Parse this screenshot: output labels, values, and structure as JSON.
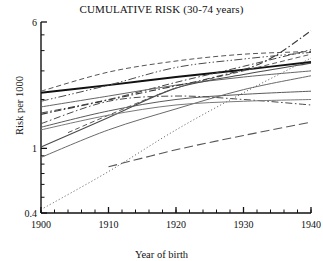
{
  "chart_data": {
    "type": "line",
    "title": "CUMULATIVE RISK (30-74 years)",
    "xlabel": "Year of birth",
    "ylabel": "Risk per 1000",
    "xlim": [
      1900,
      1940
    ],
    "ylim": [
      0.4,
      6
    ],
    "yscale": "log",
    "grid": false,
    "legend": null,
    "x_ticks": [
      1900,
      1910,
      1920,
      1930,
      1940
    ],
    "x_tick_labels": [
      "1900",
      "1910",
      "1920",
      "1930",
      "1940"
    ],
    "x_minor_step": 2,
    "y_ticks": [
      0.4,
      1,
      6
    ],
    "y_tick_labels": [
      "0.4",
      "1",
      "6"
    ],
    "y_minor_ticks": [
      0.5,
      0.6,
      0.7,
      0.8,
      0.9,
      2,
      3,
      4,
      5
    ],
    "series": [
      {
        "name": "series-1",
        "style": "solid",
        "width": 1.9,
        "color": "#111111",
        "x": [
          1900,
          1910,
          1920,
          1930,
          1940
        ],
        "values": [
          2.2,
          2.45,
          2.75,
          3.05,
          3.4
        ]
      },
      {
        "name": "series-2",
        "style": "dashed",
        "width": 1.0,
        "color": "#555555",
        "x": [
          1900,
          1910,
          1920,
          1930,
          1940
        ],
        "values": [
          2.25,
          2.95,
          3.45,
          3.8,
          3.95
        ]
      },
      {
        "name": "series-3",
        "style": "dashdot",
        "width": 1.0,
        "color": "#444444",
        "x": [
          1900,
          1910,
          1920,
          1930,
          1940
        ],
        "values": [
          1.65,
          2.0,
          2.55,
          3.2,
          4.05
        ]
      },
      {
        "name": "series-4",
        "style": "solid",
        "width": 1.0,
        "color": "#666666",
        "x": [
          1900,
          1910,
          1920,
          1930,
          1940
        ],
        "values": [
          1.8,
          2.1,
          2.45,
          2.75,
          3.0
        ]
      },
      {
        "name": "series-5",
        "style": "solid",
        "width": 1.1,
        "color": "#4a4a4a",
        "x": [
          1900,
          1910,
          1920,
          1930,
          1940
        ],
        "values": [
          1.02,
          1.55,
          2.35,
          2.85,
          3.35
        ]
      },
      {
        "name": "series-6",
        "style": "solid",
        "width": 1.0,
        "color": "#5a5a5a",
        "x": [
          1900,
          1910,
          1920,
          1930,
          1940
        ],
        "values": [
          1.35,
          1.7,
          2.0,
          2.15,
          2.25
        ]
      },
      {
        "name": "series-7",
        "style": "solid",
        "width": 1.0,
        "color": "#6a6a6a",
        "x": [
          1900,
          1910,
          1920,
          1930,
          1940
        ],
        "values": [
          0.88,
          1.3,
          1.75,
          2.3,
          2.8
        ]
      },
      {
        "name": "series-8",
        "style": "dashdot",
        "width": 1.0,
        "color": "#4a4a4a",
        "x": [
          1900,
          1910,
          1920,
          1930,
          1940
        ],
        "values": [
          1.42,
          1.95,
          2.1,
          2.0,
          1.85
        ]
      },
      {
        "name": "series-9",
        "style": "dashdotdot",
        "width": 1.0,
        "color": "#4a4a4a",
        "x": [
          1900,
          1910,
          1920,
          1930,
          1940
        ],
        "values": [
          1.95,
          2.45,
          3.15,
          3.55,
          3.9
        ]
      },
      {
        "name": "series-10",
        "style": "dashed",
        "width": 1.0,
        "color": "#5a5a5a",
        "x": [
          1904,
          1910,
          1920,
          1930,
          1940
        ],
        "values": [
          1.25,
          1.6,
          2.35,
          3.0,
          3.8
        ]
      },
      {
        "name": "series-11",
        "style": "dotted",
        "width": 1.0,
        "color": "#555555",
        "x": [
          1900,
          1910,
          1920,
          1930,
          1940
        ],
        "values": [
          0.42,
          0.72,
          1.3,
          2.2,
          3.6
        ]
      },
      {
        "name": "series-12",
        "style": "longdash",
        "width": 1.1,
        "color": "#555555",
        "x": [
          1910,
          1920,
          1930,
          1940
        ],
        "values": [
          0.77,
          0.98,
          1.2,
          1.45
        ]
      },
      {
        "name": "series-13",
        "style": "dashdot",
        "width": 1.1,
        "color": "#3a3a3a",
        "x": [
          1900,
          1915,
          1925,
          1933,
          1940
        ],
        "values": [
          1.62,
          2.2,
          2.7,
          3.4,
          5.3
        ]
      },
      {
        "name": "series-14",
        "style": "solid",
        "width": 1.0,
        "color": "#7a7a7a",
        "x": [
          1900,
          1910,
          1920,
          1930,
          1940
        ],
        "values": [
          1.3,
          1.6,
          1.85,
          1.95,
          2.0
        ]
      }
    ]
  }
}
